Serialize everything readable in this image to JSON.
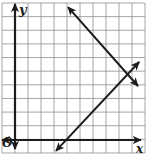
{
  "figure": {
    "kind": "coordinate-plane-graph",
    "background": "#ffffff",
    "labels": {
      "y_axis": "y",
      "x_axis": "x",
      "origin": "O"
    },
    "colors": {
      "grid": "#8f8f8f",
      "axis": "#1c1c1c",
      "line": "#1c1c1c"
    }
  },
  "chart_data": {
    "type": "line",
    "title": "",
    "xlabel": "x",
    "ylabel": "y",
    "origin_label": "O",
    "axes": {
      "x_range": [
        -1,
        10
      ],
      "y_range": [
        -1,
        10
      ],
      "grid": true,
      "grid_step": 1,
      "x_axis_arrows": "both",
      "y_axis_arrows": "both"
    },
    "series": [
      {
        "name": "positive-slope-line",
        "equation": "y = x - 4",
        "slope": 1,
        "x_intercept": 4,
        "points": [
          [
            3.15,
            -0.8
          ],
          [
            9.55,
            5.72
          ]
        ],
        "arrows": "both"
      },
      {
        "name": "negative-slope-line",
        "equation": "y = -x + 14",
        "slope": -1,
        "points": [
          [
            4.08,
            9.75
          ],
          [
            9.46,
            3.96
          ]
        ],
        "arrows": "both"
      }
    ],
    "intersection_point": [
      9,
      5
    ]
  },
  "render": {
    "width": 151,
    "height": 162,
    "grid": {
      "x0": 2,
      "y0": 3,
      "cols": 11,
      "rows": 11,
      "cellW": 13.0,
      "cellH": 13.636
    },
    "origin_px": {
      "x": 15,
      "y": 140
    },
    "y_axis_px": {
      "x": 15,
      "top": 4,
      "bottom": 149
    },
    "x_axis_px": {
      "y": 140,
      "left": 2,
      "right": 141
    },
    "label_pos": {
      "y": {
        "x": 19,
        "y": 14
      },
      "x": {
        "x": 136,
        "y": 153
      },
      "o": {
        "x": 2,
        "y": 147
      }
    }
  }
}
